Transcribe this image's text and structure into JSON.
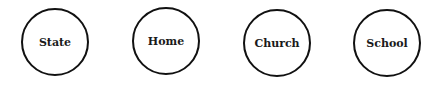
{
  "diagram": {
    "type": "institution-circles",
    "nodes": [
      {
        "label": "State"
      },
      {
        "label": "Home"
      },
      {
        "label": "Church"
      },
      {
        "label": "School"
      }
    ],
    "colors": {
      "stroke": "#111111",
      "text": "#1a1a1a",
      "background": "#ffffff"
    }
  }
}
